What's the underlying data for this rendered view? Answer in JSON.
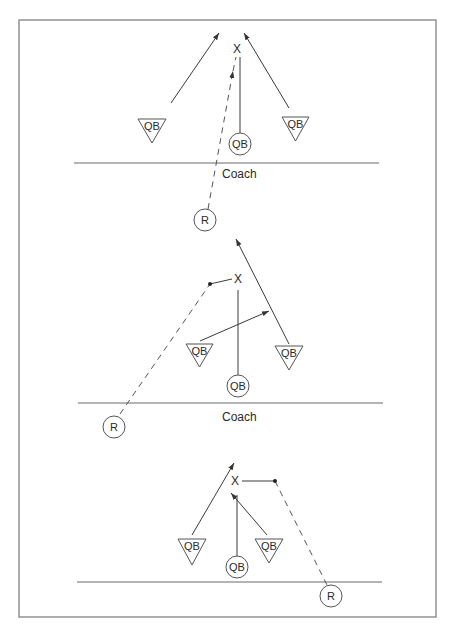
{
  "figure": {
    "frame": {
      "x": 19,
      "y": 20,
      "w": 417,
      "h": 597
    },
    "colors": {
      "line": "#3a3a3a",
      "frame": "#8a8a8a",
      "background": "#ffffff"
    }
  },
  "diagrams": [
    {
      "name": "drill-1",
      "baseline": {
        "x1": 74,
        "y1": 163,
        "x2": 379,
        "y2": 163
      },
      "coach_label": {
        "text": "Coach",
        "x": 222,
        "y": 178
      },
      "target": {
        "text": "X",
        "x": 237,
        "y": 53
      },
      "qb_triangles": [
        {
          "label": "QB",
          "x1": 138,
          "x2": 166,
          "top": 119,
          "apex_y": 143
        },
        {
          "label": "QB",
          "x1": 282,
          "x2": 309,
          "top": 117,
          "apex_y": 141
        }
      ],
      "qb_circles": [
        {
          "label": "QB",
          "cx": 240,
          "cy": 144,
          "r": 11
        }
      ],
      "receivers": [
        {
          "label": "R",
          "cx": 205,
          "cy": 220,
          "r": 11
        }
      ],
      "solid_arrows": [
        {
          "x1": 171,
          "y1": 103,
          "x2": 219,
          "y2": 33
        },
        {
          "x1": 289,
          "y1": 108,
          "x2": 244,
          "y2": 33
        }
      ],
      "solid_lines": [
        {
          "x1": 240,
          "y1": 57,
          "x2": 240,
          "y2": 133
        }
      ],
      "dashed_arrows": [
        {
          "x1": 208,
          "y1": 209,
          "x2": 233,
          "y2": 71
        }
      ],
      "dashed_lines": [
        {
          "x1": 233,
          "y1": 71,
          "x2": 236,
          "y2": 57
        }
      ],
      "dots": []
    },
    {
      "name": "drill-2",
      "baseline": {
        "x1": 78,
        "y1": 403,
        "x2": 383,
        "y2": 403
      },
      "coach_label": {
        "text": "Coach",
        "x": 222,
        "y": 421
      },
      "target": {
        "text": "X",
        "x": 238,
        "y": 283
      },
      "qb_triangles": [
        {
          "label": "QB",
          "x1": 186,
          "x2": 213,
          "top": 344,
          "apex_y": 367
        },
        {
          "label": "QB",
          "x1": 275,
          "x2": 303,
          "top": 346,
          "apex_y": 370
        }
      ],
      "qb_circles": [
        {
          "label": "QB",
          "cx": 238,
          "cy": 386,
          "r": 11
        }
      ],
      "receivers": [
        {
          "label": "R",
          "cx": 114,
          "cy": 427,
          "r": 11
        }
      ],
      "solid_arrows": [
        {
          "x1": 289,
          "y1": 344,
          "x2": 236,
          "y2": 239
        },
        {
          "x1": 200,
          "y1": 341,
          "x2": 269,
          "y2": 311
        }
      ],
      "solid_lines": [
        {
          "x1": 238,
          "y1": 290,
          "x2": 238,
          "y2": 375
        },
        {
          "x1": 210,
          "y1": 284,
          "x2": 232,
          "y2": 279
        }
      ],
      "dashed_arrows": [],
      "dashed_lines": [
        {
          "x1": 120,
          "y1": 414,
          "x2": 210,
          "y2": 284
        }
      ],
      "dots": [
        {
          "cx": 210,
          "cy": 284
        }
      ]
    },
    {
      "name": "drill-3",
      "baseline": {
        "x1": 77,
        "y1": 582,
        "x2": 382,
        "y2": 582
      },
      "coach_label": null,
      "target": {
        "text": "X",
        "x": 235,
        "y": 485
      },
      "qb_triangles": [
        {
          "label": "QB",
          "x1": 178,
          "x2": 206,
          "top": 539,
          "apex_y": 565
        },
        {
          "label": "QB",
          "x1": 255,
          "x2": 283,
          "top": 539,
          "apex_y": 563
        }
      ],
      "qb_circles": [
        {
          "label": "QB",
          "cx": 237,
          "cy": 567,
          "r": 11
        }
      ],
      "receivers": [
        {
          "label": "R",
          "cx": 331,
          "cy": 596,
          "r": 11
        }
      ],
      "solid_arrows": [
        {
          "x1": 192,
          "y1": 535,
          "x2": 234,
          "y2": 463
        },
        {
          "x1": 267,
          "y1": 535,
          "x2": 231,
          "y2": 493
        }
      ],
      "solid_lines": [
        {
          "x1": 237,
          "y1": 495,
          "x2": 237,
          "y2": 556
        },
        {
          "x1": 242,
          "y1": 481,
          "x2": 274,
          "y2": 481
        }
      ],
      "dashed_arrows": [],
      "dashed_lines": [
        {
          "x1": 275,
          "y1": 481,
          "x2": 327,
          "y2": 585
        }
      ],
      "dots": [
        {
          "cx": 275,
          "cy": 481
        }
      ]
    }
  ]
}
